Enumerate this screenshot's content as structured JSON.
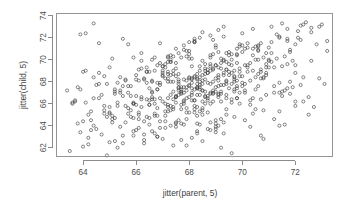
{
  "chart_data": {
    "type": "scatter",
    "title": "",
    "xlabel": "jitter(parent, 5)",
    "ylabel": "jitter(child, 5)",
    "xlim": [
      63.0,
      73.4
    ],
    "ylim": [
      61.2,
      74.2
    ],
    "xticks": [
      64,
      66,
      68,
      70,
      72
    ],
    "yticks": [
      62,
      64,
      66,
      68,
      70,
      72,
      74
    ],
    "xtick_labels": [
      "64",
      "66",
      "68",
      "70",
      "72"
    ],
    "ytick_labels": [
      "62",
      "64",
      "66",
      "68",
      "70",
      "72",
      "74"
    ],
    "grid": false,
    "legend": null,
    "marker": "open-circle",
    "marker_color": "#3a3a3a",
    "n_points": 652,
    "x": [
      63.5,
      63.6,
      63.7,
      63.8,
      63.9,
      64.0,
      64.1,
      64.2,
      64.3,
      64.4,
      63.4,
      63.9,
      64.1,
      64.5,
      64.6,
      64.2,
      63.7,
      64.4,
      64.0,
      64.8,
      63.6,
      64.3,
      64.7,
      64.9,
      65.0,
      65.1,
      65.2,
      65.3,
      65.4,
      65.5,
      64.6,
      65.0,
      65.3,
      65.6,
      65.7,
      65.1,
      64.8,
      65.5,
      65.2,
      65.8,
      64.9,
      65.4,
      65.9,
      66.0,
      66.1,
      66.2,
      66.3,
      66.4,
      66.5,
      66.6,
      65.7,
      66.1,
      66.4,
      66.7,
      66.8,
      66.2,
      65.9,
      66.6,
      66.3,
      66.9,
      66.0,
      66.5,
      67.0,
      67.1,
      67.2,
      67.3,
      67.4,
      67.5,
      67.6,
      67.7,
      66.8,
      67.2,
      67.5,
      67.8,
      67.9,
      67.3,
      67.0,
      67.7,
      67.4,
      68.0,
      67.1,
      67.6,
      68.1,
      68.2,
      68.3,
      68.4,
      68.5,
      68.6,
      68.7,
      68.8,
      67.9,
      68.3,
      68.6,
      68.9,
      69.0,
      68.4,
      68.1,
      68.8,
      68.5,
      69.1,
      68.2,
      68.7,
      69.2,
      69.3,
      69.4,
      69.5,
      69.6,
      69.7,
      69.8,
      69.9,
      69.0,
      69.4,
      69.7,
      70.0,
      70.1,
      69.5,
      69.2,
      69.9,
      69.6,
      70.2,
      69.3,
      69.8,
      70.3,
      70.4,
      70.5,
      70.6,
      70.7,
      70.8,
      70.9,
      71.0,
      70.1,
      70.5,
      70.8,
      71.1,
      71.2,
      70.6,
      70.3,
      71.0,
      70.7,
      71.3,
      70.4,
      70.9,
      71.4,
      71.5,
      71.6,
      71.7,
      71.8,
      71.9,
      72.0,
      72.1,
      71.2,
      71.6,
      71.9,
      72.2,
      72.3,
      71.7,
      71.4,
      72.1,
      71.8,
      72.4,
      71.5,
      72.0,
      72.5,
      72.6,
      72.7,
      72.8,
      72.9,
      73.0,
      73.1,
      73.2,
      64.2,
      64.7,
      65.1,
      65.6,
      66.0,
      66.5,
      66.9,
      67.4,
      67.8,
      68.3,
      64.4,
      64.9,
      65.3,
      65.8,
      66.2,
      66.7,
      67.1,
      67.6,
      68.0,
      68.5,
      65.0,
      65.5,
      65.9,
      66.4,
      66.8,
      67.3,
      67.7,
      68.2,
      68.6,
      69.1,
      65.2,
      65.7,
      66.1,
      66.6,
      67.0,
      67.5,
      67.9,
      68.4,
      68.8,
      69.3,
      65.8,
      66.3,
      66.7,
      67.2,
      67.6,
      68.1,
      68.5,
      69.0,
      69.4,
      69.9,
      66.0,
      66.5,
      66.9,
      67.4,
      67.8,
      68.3,
      68.7,
      69.2,
      69.6,
      70.1,
      66.6,
      67.1,
      67.5,
      68.0,
      68.4,
      68.9,
      69.3,
      69.8,
      70.2,
      70.7,
      66.8,
      67.3,
      67.7,
      68.2,
      68.6,
      69.1,
      69.5,
      70.0,
      70.4,
      70.9,
      67.4,
      67.9,
      68.3,
      68.8,
      69.2,
      69.7,
      70.1,
      70.6,
      71.0,
      71.5,
      67.6,
      68.1,
      68.5,
      69.0,
      69.4,
      69.9,
      70.3,
      70.8,
      71.2,
      71.7,
      68.2,
      68.7,
      69.1,
      69.6,
      70.0,
      70.5,
      70.9,
      71.4,
      71.8,
      72.3,
      68.4,
      68.9,
      69.3,
      69.8,
      70.2,
      70.7,
      71.1,
      71.6,
      72.0,
      72.5,
      63.8,
      64.3,
      64.8,
      65.2,
      65.7,
      66.2,
      66.6,
      67.1,
      67.5,
      68.0,
      64.0,
      64.5,
      65.0,
      65.4,
      65.9,
      66.4,
      66.8,
      67.3,
      67.7,
      68.2,
      64.6,
      65.1,
      65.6,
      66.0,
      66.5,
      67.0,
      67.4,
      67.9,
      68.3,
      68.8,
      64.8,
      65.3,
      65.8,
      66.2,
      66.7,
      67.2,
      67.6,
      68.1,
      68.5,
      69.0,
      65.4,
      65.9,
      66.4,
      66.8,
      67.3,
      67.8,
      68.2,
      68.7,
      69.1,
      69.6,
      65.6,
      66.1,
      66.6,
      67.0,
      67.5,
      68.0,
      68.4,
      68.9,
      69.3,
      69.8,
      66.2,
      66.7,
      67.2,
      67.6,
      68.1,
      68.6,
      69.0,
      69.5,
      69.9,
      70.4,
      66.4,
      66.9,
      67.4,
      67.8,
      68.3,
      68.8,
      69.2,
      69.7,
      70.1,
      70.6,
      67.0,
      67.5,
      68.0,
      68.4,
      68.9,
      69.4,
      69.8,
      70.3,
      70.7,
      71.2,
      67.2,
      67.7,
      68.2,
      68.6,
      69.1,
      69.6,
      70.0,
      70.5,
      70.9,
      71.4,
      67.8,
      68.3,
      68.8,
      69.2,
      69.7,
      70.2,
      70.6,
      71.1,
      71.5,
      72.0,
      68.0,
      68.5,
      69.0,
      69.4,
      69.9,
      70.4,
      70.8,
      71.3,
      71.7,
      72.2,
      66.9,
      67.2,
      67.5,
      67.8,
      68.1,
      68.4,
      68.7,
      69.0,
      69.3,
      69.6,
      67.0,
      67.3,
      67.6,
      67.9,
      68.2,
      68.5,
      68.8,
      69.1,
      69.4,
      69.7,
      67.1,
      67.4,
      67.7,
      68.0,
      68.3,
      68.6,
      68.9,
      69.2,
      69.5,
      69.8,
      67.2,
      67.5,
      67.8,
      68.1,
      68.4,
      68.7,
      69.0,
      69.3,
      69.6,
      69.9,
      67.3,
      67.6,
      67.9,
      68.2,
      68.5,
      68.8,
      69.1,
      69.4,
      69.7,
      70.0,
      66.7,
      67.0,
      67.3,
      67.6,
      67.9,
      68.2,
      68.5,
      68.8,
      69.1,
      69.4,
      66.5,
      66.8,
      67.1,
      67.4,
      67.7,
      68.0,
      68.3,
      68.6,
      68.9,
      69.2,
      66.3,
      66.6,
      66.9,
      67.2,
      67.5,
      67.8,
      68.1,
      68.4,
      68.7,
      69.0,
      68.0,
      68.3,
      68.6,
      68.9,
      69.2,
      69.5,
      69.8,
      70.1,
      70.4,
      70.7,
      68.2,
      68.5,
      68.8,
      69.1,
      69.4,
      69.7,
      70.0,
      70.3,
      70.6,
      70.9,
      65.5,
      65.9,
      66.3,
      66.7,
      67.1,
      67.5,
      67.9,
      68.3,
      68.7,
      69.1,
      65.7,
      66.1,
      66.5,
      66.9,
      67.3,
      67.7,
      68.1,
      68.5,
      68.9,
      69.3,
      69.0,
      69.4,
      69.8,
      70.2,
      70.6,
      71.0,
      71.4,
      71.8,
      72.2,
      72.6,
      64.1,
      64.6,
      65.2,
      65.9,
      66.3,
      66.8,
      67.2,
      67.9,
      68.4,
      69.0,
      70.5,
      70.8,
      71.1,
      71.4,
      71.7,
      72.0,
      72.3,
      72.6,
      72.9,
      73.2,
      63.9,
      64.4,
      65.0,
      65.5,
      66.1,
      66.6,
      67.2,
      67.7,
      68.3,
      68.8
    ],
    "y": [
      61.7,
      66.0,
      66.3,
      64.2,
      67.3,
      68.9,
      66.1,
      62.9,
      65.3,
      64.0,
      67.2,
      63.4,
      69.0,
      63.7,
      66.5,
      62.3,
      66.2,
      68.4,
      62.1,
      65.1,
      66.1,
      64.5,
      63.2,
      67.8,
      62.5,
      64.9,
      67.1,
      65.8,
      63.9,
      66.7,
      68.8,
      69.3,
      62.0,
      64.3,
      67.6,
      70.1,
      65.4,
      63.1,
      66.9,
      64.8,
      61.3,
      67.0,
      63.5,
      68.2,
      65.2,
      70.6,
      62.7,
      66.4,
      64.1,
      68.0,
      71.4,
      65.0,
      67.9,
      63.3,
      69.5,
      66.6,
      64.7,
      70.0,
      62.4,
      67.7,
      63.6,
      65.9,
      68.6,
      64.4,
      70.3,
      66.8,
      62.2,
      69.2,
      67.4,
      65.5,
      63.0,
      68.3,
      71.0,
      66.0,
      64.6,
      69.8,
      62.8,
      67.5,
      65.7,
      70.5,
      63.8,
      68.7,
      66.3,
      71.6,
      64.9,
      69.4,
      62.6,
      67.1,
      65.2,
      70.2,
      68.1,
      63.3,
      66.7,
      71.8,
      64.2,
      69.0,
      62.9,
      67.8,
      65.6,
      70.7,
      68.5,
      63.7,
      66.2,
      72.1,
      65.0,
      69.6,
      61.5,
      68.2,
      66.5,
      71.2,
      63.4,
      69.1,
      64.8,
      72.4,
      67.0,
      70.4,
      62.0,
      68.9,
      66.1,
      71.5,
      64.3,
      69.7,
      65.9,
      72.8,
      67.3,
      70.9,
      63.1,
      68.4,
      66.8,
      71.1,
      64.5,
      70.0,
      65.4,
      73.0,
      67.6,
      71.3,
      63.9,
      69.3,
      66.4,
      72.3,
      65.1,
      70.6,
      64.0,
      73.3,
      67.2,
      71.7,
      66.9,
      69.9,
      65.8,
      72.6,
      64.6,
      70.3,
      67.5,
      73.1,
      66.2,
      71.9,
      65.3,
      72.0,
      68.0,
      73.4,
      67.1,
      69.5,
      66.6,
      72.9,
      65.7,
      71.4,
      68.3,
      73.2,
      67.8,
      70.8,
      65.0,
      66.8,
      64.3,
      68.1,
      65.9,
      67.4,
      63.8,
      69.0,
      66.3,
      68.7,
      66.5,
      64.8,
      67.9,
      65.4,
      69.2,
      66.0,
      68.3,
      64.5,
      70.1,
      67.2,
      65.7,
      67.6,
      66.1,
      68.9,
      64.9,
      70.4,
      67.0,
      65.2,
      69.6,
      68.1,
      67.3,
      65.6,
      69.1,
      66.4,
      68.5,
      64.2,
      70.8,
      67.7,
      66.0,
      69.9,
      66.7,
      68.2,
      65.1,
      70.2,
      67.5,
      69.4,
      66.2,
      71.1,
      68.0,
      67.0,
      68.6,
      66.3,
      69.7,
      65.5,
      71.3,
      67.4,
      68.8,
      66.9,
      70.5,
      67.8,
      67.1,
      69.3,
      66.6,
      71.6,
      68.4,
      67.2,
      70.0,
      66.5,
      69.5,
      68.9,
      67.9,
      69.8,
      67.3,
      71.9,
      68.2,
      66.8,
      70.7,
      67.6,
      69.0,
      68.6,
      68.0,
      70.3,
      67.5,
      72.2,
      69.2,
      67.1,
      71.0,
      68.7,
      69.9,
      66.7,
      70.6,
      68.3,
      72.5,
      69.5,
      67.8,
      71.4,
      68.1,
      70.2,
      69.3,
      67.4,
      71.7,
      68.8,
      72.7,
      70.0,
      68.5,
      71.2,
      69.6,
      67.0,
      70.9,
      68.4,
      72.0,
      69.1,
      73.0,
      70.4,
      68.9,
      71.5,
      69.8,
      64.1,
      66.2,
      65.0,
      67.5,
      63.6,
      65.8,
      64.7,
      67.0,
      66.4,
      68.1,
      65.3,
      63.9,
      66.6,
      64.4,
      67.7,
      65.1,
      68.4,
      66.0,
      64.8,
      67.3,
      64.0,
      66.9,
      65.5,
      67.8,
      64.6,
      68.2,
      66.7,
      65.9,
      68.8,
      67.1,
      65.2,
      67.4,
      64.3,
      68.5,
      66.1,
      67.6,
      65.7,
      69.0,
      66.5,
      68.0,
      66.8,
      65.4,
      68.3,
      67.2,
      66.0,
      69.3,
      65.6,
      68.6,
      67.5,
      66.3,
      67.9,
      66.6,
      69.5,
      65.8,
      68.1,
      67.0,
      66.2,
      69.7,
      68.4,
      67.3,
      66.9,
      68.8,
      67.6,
      69.9,
      66.4,
      68.0,
      67.8,
      70.1,
      68.7,
      67.1,
      67.4,
      69.2,
      66.5,
      68.9,
      67.9,
      70.3,
      68.2,
      66.8,
      69.6,
      67.7,
      68.5,
      67.2,
      70.0,
      69.4,
      66.6,
      68.3,
      67.5,
      70.5,
      69.8,
      68.1,
      66.3,
      69.1,
      67.0,
      68.7,
      70.2,
      67.3,
      69.0,
      68.6,
      67.8,
      70.7,
      68.4,
      69.3,
      67.9,
      70.9,
      68.2,
      70.4,
      69.7,
      68.0,
      71.1,
      67.6,
      70.6,
      69.4,
      68.8,
      70.8,
      67.2,
      71.3,
      69.1,
      68.5,
      71.0,
      68.3,
      70.1,
      69.6,
      67.7,
      71.5,
      68.9,
      66.1,
      67.0,
      68.2,
      66.8,
      69.1,
      67.5,
      68.6,
      66.4,
      69.4,
      68.0,
      67.2,
      66.5,
      68.4,
      67.8,
      69.0,
      66.9,
      68.1,
      67.3,
      69.6,
      68.7,
      65.9,
      67.6,
      68.3,
      66.6,
      69.2,
      67.1,
      68.9,
      67.4,
      69.8,
      68.5,
      66.2,
      67.9,
      68.0,
      66.7,
      69.5,
      67.7,
      68.8,
      66.0,
      70.0,
      68.2,
      67.5,
      66.3,
      68.6,
      67.0,
      69.3,
      66.5,
      68.4,
      67.9,
      70.2,
      69.0,
      65.4,
      66.8,
      67.2,
      65.8,
      68.1,
      66.9,
      67.6,
      65.5,
      68.9,
      67.3,
      64.9,
      66.4,
      67.1,
      65.2,
      67.8,
      66.0,
      67.0,
      64.6,
      68.3,
      66.6,
      64.4,
      65.9,
      66.7,
      64.1,
      67.4,
      65.3,
      66.5,
      63.9,
      67.7,
      65.7,
      69.2,
      68.0,
      70.1,
      68.6,
      71.0,
      69.5,
      70.4,
      68.3,
      71.6,
      69.9,
      69.4,
      68.4,
      70.6,
      69.0,
      71.3,
      69.7,
      70.8,
      68.8,
      71.9,
      70.2,
      63.2,
      64.9,
      66.0,
      64.3,
      65.6,
      63.5,
      66.3,
      64.0,
      65.1,
      63.8,
      64.7,
      66.5,
      65.8,
      64.2,
      67.0,
      65.0,
      66.2,
      63.3,
      64.5,
      66.8,
      70.5,
      69.3,
      71.2,
      70.0,
      72.1,
      70.7,
      71.8,
      69.9,
      72.4,
      71.5,
      62.6,
      63.1,
      64.4,
      63.0,
      65.3,
      62.2,
      64.1,
      63.7,
      65.5,
      62.8,
      71.6,
      72.0,
      72.8,
      71.4,
      73.2,
      72.5,
      73.0,
      71.7,
      72.3,
      73.3,
      65.2,
      62.4,
      64.6,
      63.5,
      65.7,
      62.7,
      64.2,
      63.6,
      65.0,
      62.1
    ]
  },
  "axis": {
    "x_title": "jitter(parent, 5)",
    "y_title": "jitter(child, 5)"
  }
}
